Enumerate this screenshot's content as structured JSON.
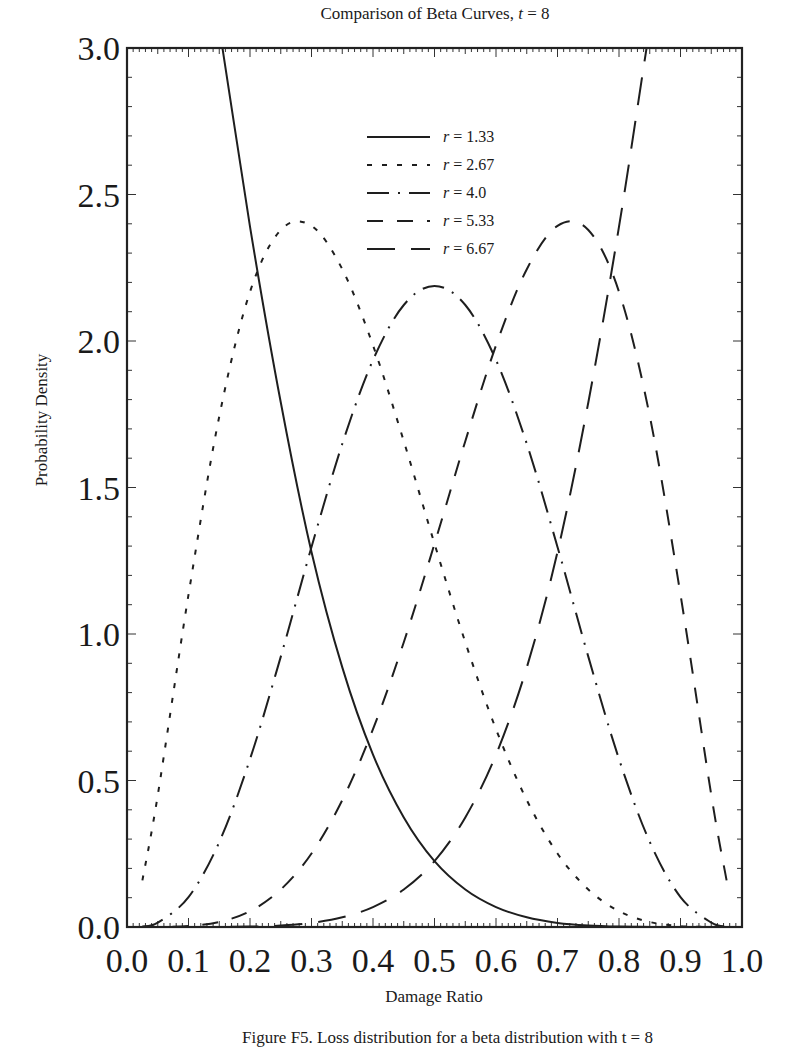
{
  "chart_data": {
    "type": "line",
    "title": "Comparison of Beta Curves, t = 8",
    "title_prefix": "Comparison of Beta Curves, ",
    "title_var": "t",
    "title_suffix": " = 8",
    "xlabel": "Damage Ratio",
    "ylabel": "Probability Density",
    "xlim": [
      0.0,
      1.0
    ],
    "ylim": [
      0.0,
      3.0
    ],
    "x_ticks": [
      "0.0",
      "0.1",
      "0.2",
      "0.3",
      "0.4",
      "0.5",
      "0.6",
      "0.7",
      "0.8",
      "0.9",
      "1.0"
    ],
    "y_ticks": [
      "0.0",
      "0.5",
      "1.0",
      "1.5",
      "2.0",
      "2.5",
      "3.0"
    ],
    "grid": false,
    "legend_position": "upper center",
    "x": [
      0.025,
      0.05,
      0.1,
      0.15,
      0.2,
      0.25,
      0.3,
      0.35,
      0.4,
      0.45,
      0.5,
      0.55,
      0.6,
      0.65,
      0.7,
      0.75,
      0.8,
      0.85,
      0.9,
      0.95,
      0.975
    ],
    "series": [
      {
        "name": "r = 1.33",
        "var": "r",
        "value": "1.33",
        "dash": "",
        "values": [
          5.67,
          4.66,
          3.71,
          3.07,
          2.39,
          1.79,
          1.28,
          0.886,
          0.588,
          0.374,
          0.225,
          0.128,
          0.068,
          0.033,
          0.014,
          0.005,
          0.0014,
          0.0003,
          0.0,
          0.0,
          0.0
        ]
      },
      {
        "name": "r = 2.67",
        "var": "r",
        "value": "2.67",
        "dash": "5 10",
        "values": [
          0.159,
          0.45,
          1.134,
          1.743,
          2.168,
          2.379,
          2.393,
          2.245,
          1.985,
          1.658,
          1.308,
          0.972,
          0.675,
          0.433,
          0.251,
          0.128,
          0.054,
          0.017,
          0.003,
          0.0002,
          0.0
        ]
      },
      {
        "name": "r = 4.0",
        "var": "r",
        "value": "4.0",
        "dash": "22 9 2 9",
        "values": [
          0.002,
          0.015,
          0.102,
          0.29,
          0.573,
          0.923,
          1.297,
          1.649,
          1.935,
          2.123,
          2.188,
          2.123,
          1.935,
          1.649,
          1.297,
          0.923,
          0.573,
          0.29,
          0.102,
          0.015,
          0.002
        ]
      },
      {
        "name": "r = 5.33",
        "var": "r",
        "value": "5.33",
        "dash": "16 14",
        "values": [
          0.0,
          0.0002,
          0.003,
          0.017,
          0.054,
          0.128,
          0.251,
          0.433,
          0.675,
          0.972,
          1.308,
          1.658,
          1.985,
          2.245,
          2.393,
          2.379,
          2.168,
          1.743,
          1.134,
          0.45,
          0.159
        ]
      },
      {
        "name": "r = 6.67",
        "var": "r",
        "value": "6.67",
        "dash": "28 16",
        "values": [
          0.0,
          0.0,
          0.0,
          0.0003,
          0.0014,
          0.005,
          0.014,
          0.033,
          0.068,
          0.128,
          0.225,
          0.374,
          0.588,
          0.886,
          1.28,
          1.79,
          2.39,
          3.07,
          3.71,
          4.66,
          5.67
        ]
      }
    ],
    "line_color": "#1e1e1e"
  },
  "caption": "Figure F5. Loss distribution for a beta distribution with t = 8"
}
